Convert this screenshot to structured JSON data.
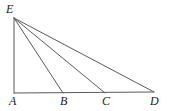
{
  "figure": {
    "type": "geometry-diagram",
    "stroke_color": "#5a5a5a",
    "label_color": "#1c1c1c",
    "background_color": "#ffffff",
    "stroke_width": 1,
    "points": [
      {
        "name": "E",
        "label": "E",
        "x": 14,
        "y": 18,
        "label_x": 6,
        "label_y": 3
      },
      {
        "name": "A",
        "label": "A",
        "x": 14,
        "y": 93,
        "label_x": 9,
        "label_y": 95
      },
      {
        "name": "B",
        "label": "B",
        "x": 63,
        "y": 93,
        "label_x": 60,
        "label_y": 95
      },
      {
        "name": "C",
        "label": "C",
        "x": 105,
        "y": 93,
        "label_x": 102,
        "label_y": 95
      },
      {
        "name": "D",
        "label": "D",
        "x": 154,
        "y": 92,
        "label_x": 150,
        "label_y": 95
      }
    ],
    "segments": [
      {
        "name": "segment-AE",
        "from": "A",
        "to": "E",
        "x1": 14,
        "y1": 93,
        "x2": 14,
        "y2": 18
      },
      {
        "name": "segment-AD",
        "from": "A",
        "to": "D",
        "x1": 14,
        "y1": 93,
        "x2": 154,
        "y2": 92
      },
      {
        "name": "segment-EB",
        "from": "E",
        "to": "B",
        "x1": 14,
        "y1": 18,
        "x2": 63,
        "y2": 93
      },
      {
        "name": "segment-EC",
        "from": "E",
        "to": "C",
        "x1": 14,
        "y1": 18,
        "x2": 105,
        "y2": 93
      },
      {
        "name": "segment-ED",
        "from": "E",
        "to": "D",
        "x1": 14,
        "y1": 18,
        "x2": 154,
        "y2": 92
      }
    ]
  }
}
